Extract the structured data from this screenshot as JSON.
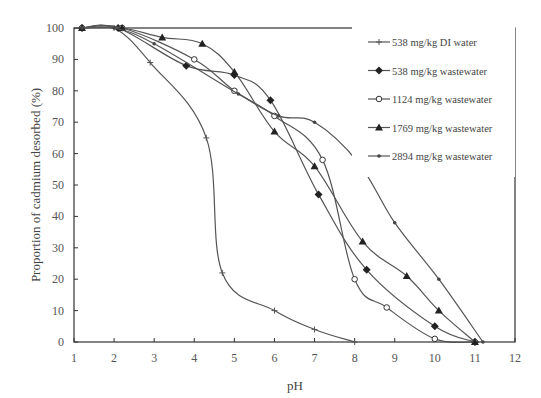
{
  "chart_data": {
    "type": "line",
    "title": "",
    "xlabel": "pH",
    "ylabel": "Proportion of cadmium desorbed (%)",
    "xlim": [
      1,
      12
    ],
    "ylim": [
      0,
      100
    ],
    "x_ticks": [
      1,
      2,
      3,
      4,
      5,
      6,
      7,
      8,
      9,
      10,
      11,
      12
    ],
    "y_ticks": [
      0,
      10,
      20,
      30,
      40,
      50,
      60,
      70,
      80,
      90,
      100
    ],
    "grid": false,
    "legend_position": "upper right (inside)",
    "series": [
      {
        "name": "538 mg/kg DI water",
        "marker": "plus",
        "x": [
          1.2,
          2.0,
          2.9,
          4.3,
          4.7,
          6.0,
          7.0,
          8.0
        ],
        "y": [
          100,
          100,
          89,
          65,
          22,
          10,
          4,
          0
        ]
      },
      {
        "name": "538 mg/kg wastewater",
        "marker": "diamond-filled",
        "x": [
          1.2,
          2.1,
          3.8,
          5.0,
          5.9,
          7.1,
          8.3,
          10.0,
          11.0
        ],
        "y": [
          100,
          100,
          88,
          85,
          77,
          47,
          23,
          5,
          0
        ]
      },
      {
        "name": "1124 mg/kg wastewater",
        "marker": "circle-open",
        "x": [
          1.2,
          2.2,
          4.0,
          5.0,
          6.0,
          7.2,
          8.0,
          8.8,
          10.0,
          11.0
        ],
        "y": [
          100,
          100,
          90,
          80,
          72,
          58,
          20,
          11,
          1,
          0
        ]
      },
      {
        "name": "1769 mg/kg wastewater",
        "marker": "triangle-filled",
        "x": [
          1.2,
          2.2,
          3.2,
          4.2,
          5.0,
          6.0,
          7.0,
          8.2,
          9.3,
          10.1,
          11.0
        ],
        "y": [
          100,
          100,
          97,
          95,
          86,
          67,
          56,
          32,
          21,
          10,
          0
        ]
      },
      {
        "name": "2894 mg/kg wastewater",
        "marker": "dot",
        "x": [
          1.2,
          2.0,
          3.0,
          5.1,
          6.1,
          7.0,
          8.1,
          9.0,
          10.1,
          11.2
        ],
        "y": [
          100,
          100,
          95,
          79,
          72,
          70,
          57,
          38,
          20,
          0
        ]
      }
    ]
  },
  "legend": {
    "items": [
      "538 mg/kg DI water",
      "538 mg/kg wastewater",
      "1124 mg/kg wastewater",
      "1769 mg/kg wastewater",
      "2894 mg/kg wastewater"
    ]
  },
  "colors": {
    "line": "#555555",
    "axis": "#333333",
    "text": "#555555"
  }
}
